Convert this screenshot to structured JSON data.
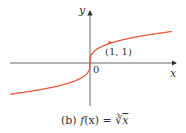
{
  "chart_data": {
    "type": "line",
    "title": "",
    "caption": "(b) f(x) = ∛x",
    "xlabel": "x",
    "ylabel": "y",
    "function": "f(x) = cube root of x",
    "origin_label": "0",
    "annotations": [
      {
        "label": "(1, 1)",
        "x": 1,
        "y": 1
      }
    ],
    "series": [
      {
        "name": "f(x) = ∛x",
        "color": "#e8583a",
        "x": [
          -3.8,
          -3,
          -2,
          -1,
          -0.5,
          -0.125,
          0,
          0.125,
          0.5,
          1,
          2,
          3,
          3.9
        ],
        "y": [
          -1.56,
          -1.44,
          -1.26,
          -1.0,
          -0.79,
          -0.5,
          0,
          0.5,
          0.79,
          1.0,
          1.26,
          1.44,
          1.57
        ]
      }
    ],
    "xlim": [
      -3.9,
      4.0
    ],
    "ylim": [
      -2.1,
      2.5
    ],
    "grid": false,
    "legend": "none"
  },
  "labels": {
    "y_axis": "y",
    "x_axis": "x",
    "origin": "0",
    "point": "(1, 1)",
    "caption_prefix": "(b) ",
    "caption_func": "f",
    "caption_rest": "(x) = ",
    "caption_root": "∛",
    "caption_var": "x"
  },
  "colors": {
    "curve": "#e8583a",
    "axis": "#333333",
    "text": "#333333"
  }
}
